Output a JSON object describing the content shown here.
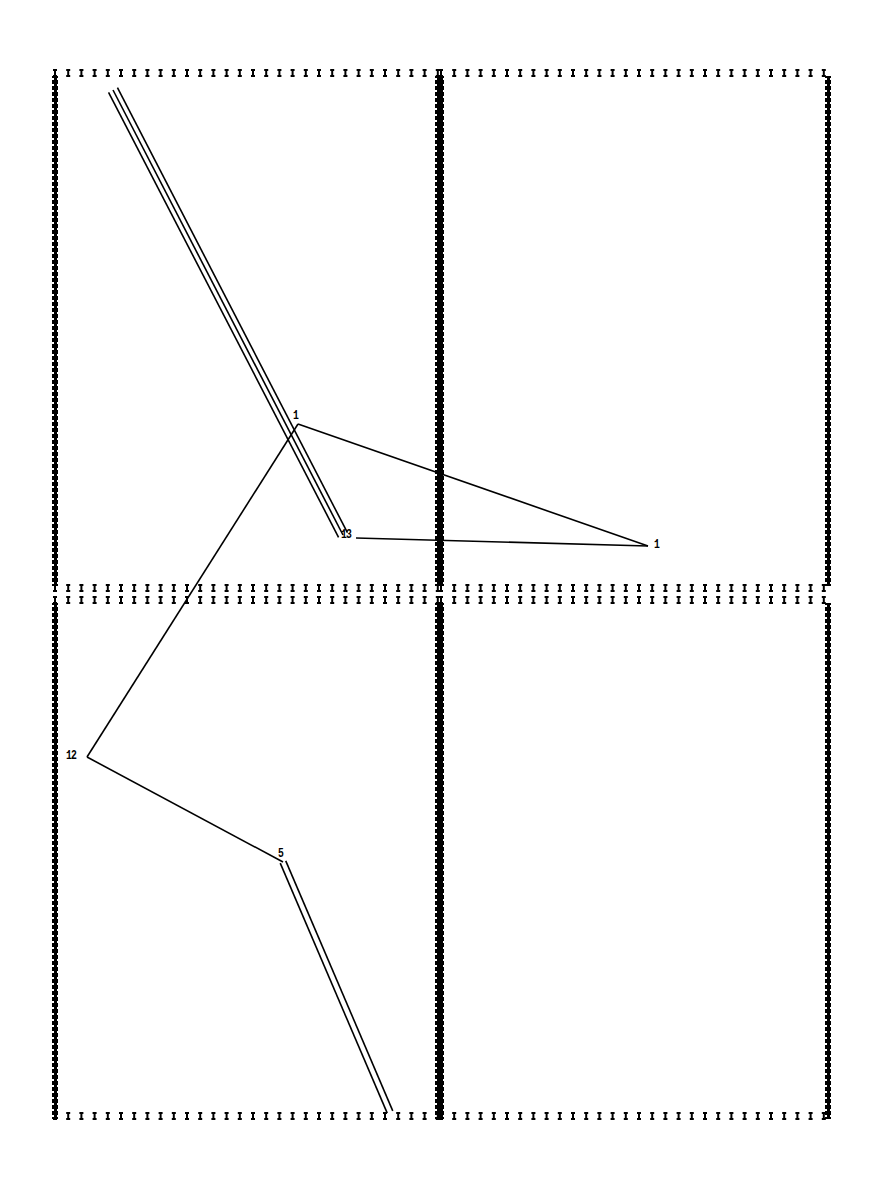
{
  "figure": {
    "type": "plotter-output",
    "background": "#ffffff",
    "ink": "#000000",
    "panels": [
      {
        "id": "top-left",
        "x1": 55,
        "y1": 73,
        "x2": 438,
        "y2": 588
      },
      {
        "id": "top-right",
        "x1": 441,
        "y1": 73,
        "x2": 828,
        "y2": 588
      },
      {
        "id": "bottom-left",
        "x1": 55,
        "y1": 600,
        "x2": 438,
        "y2": 1116
      },
      {
        "id": "bottom-right",
        "x1": 441,
        "y1": 600,
        "x2": 828,
        "y2": 1116
      }
    ],
    "nodes": [
      {
        "label": "",
        "x": 118,
        "y": 95
      },
      {
        "label": "1",
        "x": 298,
        "y": 424
      },
      {
        "label": "13",
        "x": 342,
        "y": 537
      },
      {
        "label": "1",
        "x": 648,
        "y": 546
      },
      {
        "label": "12",
        "x": 87,
        "y": 757
      },
      {
        "label": "5",
        "x": 283,
        "y": 862
      },
      {
        "label": "",
        "x": 390,
        "y": 1112
      }
    ],
    "labels": [
      {
        "text": "1",
        "x": 293,
        "y": 409
      },
      {
        "text": "13",
        "x": 341,
        "y": 528
      },
      {
        "text": "1",
        "x": 654,
        "y": 538
      },
      {
        "text": "12",
        "x": 66,
        "y": 749
      },
      {
        "text": "5",
        "x": 278,
        "y": 847
      }
    ],
    "segments": [
      {
        "from": [
          113,
          90
        ],
        "to": [
          343,
          535
        ],
        "style": "triple"
      },
      {
        "from": [
          298,
          424
        ],
        "to": [
          648,
          546
        ],
        "style": "single"
      },
      {
        "from": [
          356,
          538
        ],
        "to": [
          648,
          546
        ],
        "style": "single"
      },
      {
        "from": [
          298,
          424
        ],
        "to": [
          87,
          757
        ],
        "style": "single"
      },
      {
        "from": [
          87,
          757
        ],
        "to": [
          283,
          862
        ],
        "style": "single"
      },
      {
        "from": [
          283,
          862
        ],
        "to": [
          390,
          1112
        ],
        "style": "double"
      }
    ]
  }
}
